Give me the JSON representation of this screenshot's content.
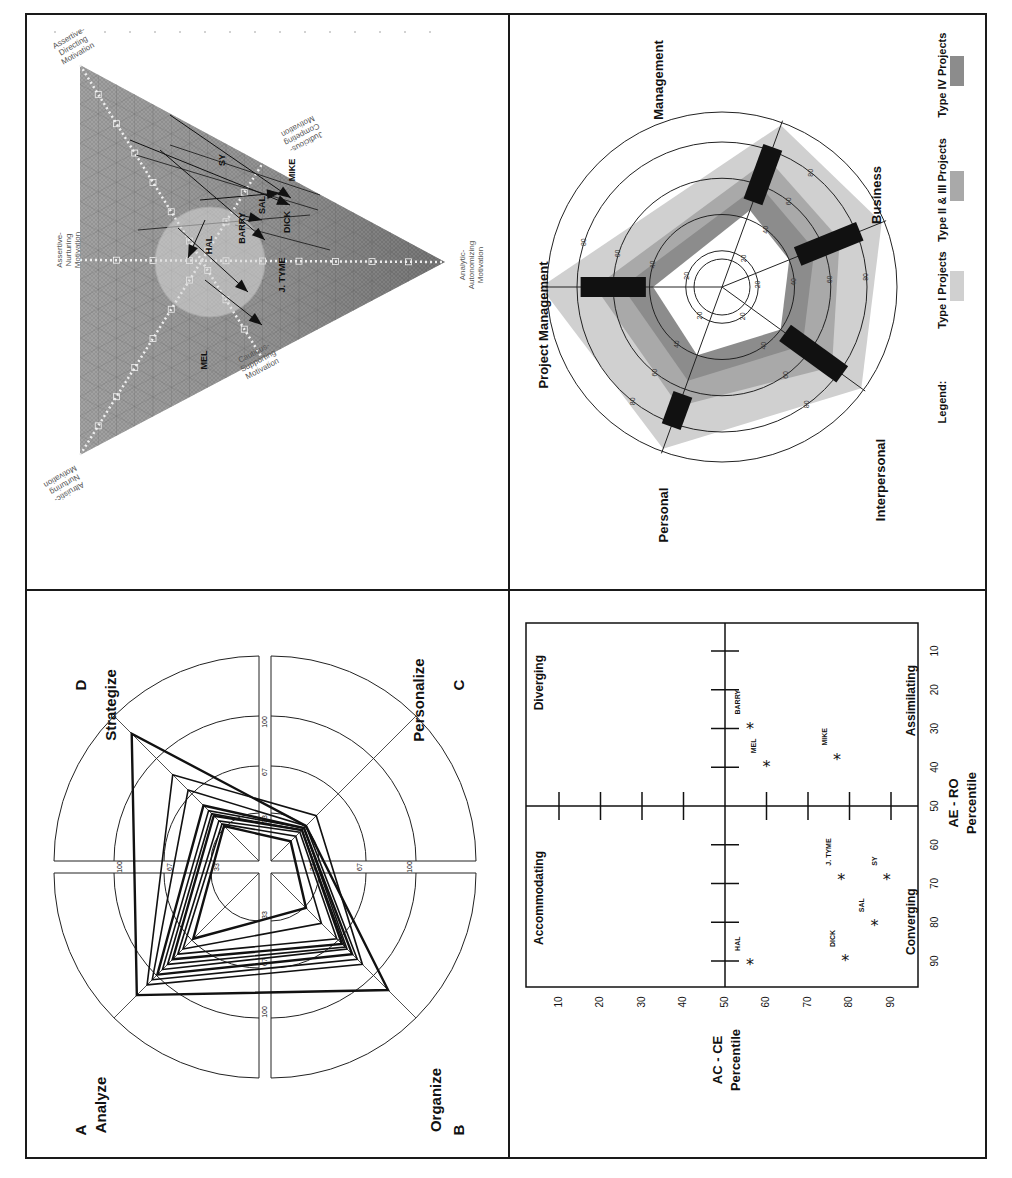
{
  "page": {
    "orientation": "rotated 90 degrees counter-clockwise",
    "panels": [
      "triangle-motivation",
      "project-type-radar",
      "whole-brain-radar",
      "learning-style-scatter"
    ]
  },
  "chart_data": [
    {
      "id": "triangle",
      "type": "diagram",
      "title": "",
      "vertex_labels": {
        "top": "Assertive-Directing Motivation",
        "bottom": "Altruistic-Nurturing Motivation",
        "right": "Analytic-Autonomizing Motivation"
      },
      "edge_labels": {
        "left": "Assertive-Nurturing Motivation",
        "upper_right": "Judicious-Competing Motivation",
        "lower_right": "Cautious-Supporting Motivation"
      },
      "people": [
        "HAL",
        "BARRY",
        "SAL",
        "DICK",
        "J. TYME",
        "SY",
        "MIKE",
        "MEL"
      ],
      "colors": {
        "fill_dark": "#6e6e6e",
        "fill_light": "#bdbdbd",
        "hatch": "#8a8a8a"
      }
    },
    {
      "id": "project-radar",
      "type": "radar",
      "axes": [
        "Management",
        "Business",
        "Interpersonal",
        "Personal",
        "Project Management"
      ],
      "ring_ticks": [
        20,
        40,
        60,
        80
      ],
      "range": [
        0,
        100
      ],
      "series": [
        {
          "name": "Type I Projects",
          "values": [
            95,
            95,
            95,
            95,
            100
          ],
          "color": "#d0d0d0"
        },
        {
          "name": "Type II & III Projects",
          "values": [
            75,
            70,
            75,
            70,
            70
          ],
          "color": "#a9a9a9"
        },
        {
          "name": "Type IV Projects",
          "values": [
            60,
            55,
            55,
            55,
            55
          ],
          "color": "#8c8c8c"
        }
      ],
      "bars": [
        {
          "axis": "Management",
          "from": 50,
          "to": 82
        },
        {
          "axis": "Business",
          "from": 45,
          "to": 82
        },
        {
          "axis": "Interpersonal",
          "from": 43,
          "to": 82
        },
        {
          "axis": "Personal",
          "from": 63,
          "to": 82
        },
        {
          "axis": "Project Management",
          "from": 42,
          "to": 78
        }
      ],
      "legend": {
        "title": "Legend:",
        "items": [
          "Type I Projects",
          "Type II & III Projects",
          "Type IV Projects"
        ],
        "placement": "right"
      }
    },
    {
      "id": "brain-radar",
      "type": "radar",
      "quadrants": [
        {
          "letter": "A",
          "label": "Analyze"
        },
        {
          "letter": "B",
          "label": "Organize"
        },
        {
          "letter": "C",
          "label": "Personalize"
        },
        {
          "letter": "D",
          "label": "Strategize"
        }
      ],
      "ring_ticks": [
        33,
        67,
        100
      ],
      "axes_order": [
        "A",
        "B",
        "C",
        "D"
      ],
      "series_note": "many overlapping profiles",
      "series": [
        {
          "values": [
            125,
            120,
            40,
            130
          ]
        },
        {
          "values": [
            115,
            95,
            50,
            90
          ]
        },
        {
          "values": [
            110,
            90,
            40,
            75
          ]
        },
        {
          "values": [
            105,
            85,
            38,
            60
          ]
        },
        {
          "values": [
            100,
            80,
            38,
            55
          ]
        },
        {
          "values": [
            95,
            78,
            36,
            52
          ]
        },
        {
          "values": [
            90,
            75,
            36,
            50
          ]
        },
        {
          "values": [
            85,
            70,
            34,
            45
          ]
        },
        {
          "values": [
            80,
            55,
            30,
            42
          ]
        },
        {
          "values": [
            70,
            40,
            25,
            40
          ]
        }
      ]
    },
    {
      "id": "learning-scatter",
      "type": "scatter",
      "xlabel": "AC - CE Percentile",
      "ylabel": "AE - RO Percentile",
      "xlim": [
        0,
        100
      ],
      "ylim": [
        0,
        100
      ],
      "ticks": [
        10,
        20,
        30,
        40,
        50,
        60,
        70,
        80,
        90
      ],
      "quadrant_labels": [
        "Diverging",
        "Assimilating",
        "Converging",
        "Accommodating"
      ],
      "points": [
        {
          "name": "BARRY",
          "x": 56,
          "y": 30
        },
        {
          "name": "MEL",
          "x": 60,
          "y": 40
        },
        {
          "name": "MIKE",
          "x": 77,
          "y": 38
        },
        {
          "name": "J. TYME",
          "x": 78,
          "y": 69
        },
        {
          "name": "SY",
          "x": 89,
          "y": 69
        },
        {
          "name": "SAL",
          "x": 86,
          "y": 81
        },
        {
          "name": "DICK",
          "x": 79,
          "y": 90
        },
        {
          "name": "HAL",
          "x": 56,
          "y": 91
        }
      ]
    }
  ]
}
